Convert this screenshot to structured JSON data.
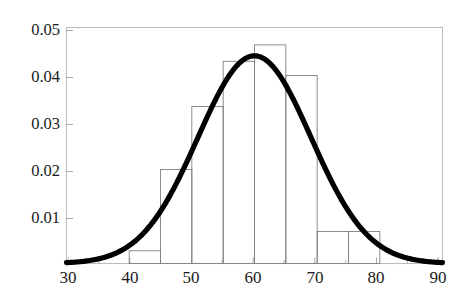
{
  "chart_data": {
    "type": "bar",
    "title": "",
    "subtitle": "",
    "xlabel": "",
    "ylabel": "",
    "xlim": [
      30,
      90
    ],
    "ylim": [
      0,
      0.0502
    ],
    "grid": false,
    "legend": null,
    "annotations": [],
    "bin_width": 5,
    "bin_edges": [
      40,
      45,
      50,
      55,
      60,
      65,
      70,
      75,
      80
    ],
    "categories": [
      "40-45",
      "45-50",
      "50-55",
      "55-60",
      "60-65",
      "65-70",
      "70-75",
      "75-80"
    ],
    "values": [
      0.0027,
      0.02,
      0.0334,
      0.043,
      0.0465,
      0.04,
      0.0068,
      0.0068
    ],
    "bar_style": {
      "fill": "none",
      "stroke": "#808080",
      "stroke_width": 0.9
    },
    "overlay_curve": {
      "type": "line",
      "name": "normal density",
      "mean": 60,
      "sigma": 9.03,
      "peak_value": 0.0442,
      "x_range": [
        30,
        90
      ],
      "stroke": "#000000",
      "stroke_width": 5.2
    },
    "xticks": [
      30,
      40,
      50,
      60,
      70,
      80,
      90
    ],
    "xtick_labels": [
      "30",
      "40",
      "50",
      "60",
      "70",
      "80",
      "90"
    ],
    "xticks_minor": [
      35,
      45,
      55,
      65,
      75,
      85
    ],
    "yticks": [
      0.01,
      0.02,
      0.03,
      0.04,
      0.05
    ],
    "ytick_labels": [
      "0.01",
      "0.02",
      "0.03",
      "0.04",
      "0.05"
    ],
    "frame": {
      "stroke": "#b8b8b8",
      "stroke_width": 1.1,
      "visible_sides": [
        "left",
        "top",
        "right",
        "bottom"
      ]
    }
  },
  "axis": {
    "x": {
      "labels": [
        "30",
        "40",
        "50",
        "60",
        "70",
        "80",
        "90"
      ]
    },
    "y": {
      "labels": [
        "0.05",
        "0.04",
        "0.03",
        "0.02",
        "0.01"
      ]
    }
  }
}
